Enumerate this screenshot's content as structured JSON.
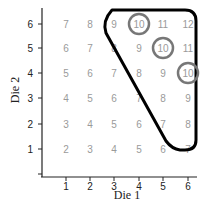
{
  "chart_data": {
    "type": "table",
    "title": "",
    "xlabel": "Die 1",
    "ylabel": "Die 2",
    "x_ticks": [
      "1",
      "2",
      "3",
      "4",
      "5",
      "6"
    ],
    "y_ticks": [
      "1",
      "2",
      "3",
      "4",
      "5",
      "6"
    ],
    "grid": false,
    "rows": [
      {
        "die2": 6,
        "sums": [
          7,
          8,
          9,
          10,
          11,
          12
        ]
      },
      {
        "die2": 5,
        "sums": [
          6,
          7,
          8,
          9,
          10,
          11
        ]
      },
      {
        "die2": 4,
        "sums": [
          5,
          6,
          7,
          8,
          9,
          10
        ]
      },
      {
        "die2": 3,
        "sums": [
          4,
          5,
          6,
          7,
          8,
          9
        ]
      },
      {
        "die2": 2,
        "sums": [
          3,
          4,
          5,
          6,
          7,
          8
        ]
      },
      {
        "die2": 1,
        "sums": [
          2,
          3,
          4,
          5,
          6,
          7
        ]
      }
    ],
    "annotations": {
      "circled": [
        {
          "die1": 4,
          "die2": 6,
          "value": 10
        },
        {
          "die1": 5,
          "die2": 5,
          "value": 10
        },
        {
          "die1": 6,
          "die2": 4,
          "value": 10
        }
      ],
      "outlined_region": "sum >= 9 (triangle)"
    }
  },
  "colors": {
    "cell_text": "#9a9a9a",
    "circle": "#777777",
    "outline": "#000000",
    "axis": "#222222"
  }
}
